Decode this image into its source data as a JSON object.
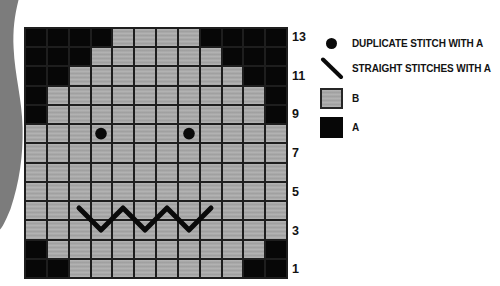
{
  "page": {
    "background": "#ffffff"
  },
  "colors": {
    "color_a": "#070707",
    "color_b": "#a9a9a9",
    "grid_line": "#1e1e1e",
    "ribbon": "#7c7c7c",
    "text": "#131313"
  },
  "chart": {
    "columns": 12,
    "row_count": 13,
    "rows": [
      {
        "row": 13,
        "cells": "AAAABBBBAAAA"
      },
      {
        "row": 12,
        "cells": "AAABBBBBBAAA"
      },
      {
        "row": 11,
        "cells": "AABBBBBBBBAA"
      },
      {
        "row": 10,
        "cells": "ABBBBBBBBBBA"
      },
      {
        "row": 9,
        "cells": "ABBBBBBBBBBA"
      },
      {
        "row": 8,
        "cells": "BBBBBBBBBBBB"
      },
      {
        "row": 7,
        "cells": "BBBBBBBBBBBB"
      },
      {
        "row": 6,
        "cells": "BBBBBBBBBBBB"
      },
      {
        "row": 5,
        "cells": "BBBBBBBBBBBB"
      },
      {
        "row": 4,
        "cells": "BBBBBBBBBBBB"
      },
      {
        "row": 3,
        "cells": "BBBBBBBBBBBB"
      },
      {
        "row": 2,
        "cells": "ABBBBBBBBBBA"
      },
      {
        "row": 1,
        "cells": "AABBBBBBBBAA"
      }
    ],
    "visible_row_labels": [
      "13",
      "11",
      "9",
      "7",
      "5",
      "3",
      "1"
    ],
    "duplicate_stitches_a": [
      {
        "row": 8,
        "col": 4
      },
      {
        "row": 8,
        "col": 8
      }
    ],
    "straight_stitches_a": {
      "shape": "zigzag",
      "points_col_row_units": [
        [
          2.5,
          9.33
        ],
        [
          3.5,
          10.47
        ],
        [
          4.5,
          9.33
        ],
        [
          5.5,
          10.47
        ],
        [
          6.5,
          9.33
        ],
        [
          7.5,
          10.47
        ],
        [
          8.5,
          9.33
        ]
      ]
    }
  },
  "legend": {
    "items": [
      {
        "icon": "filled-circle",
        "label": "DUPLICATE STITCH WITH A"
      },
      {
        "icon": "diagonal-line",
        "label": "STRAIGHT STITCHES WITH A"
      },
      {
        "icon": "color-b-swatch",
        "label": "B"
      },
      {
        "icon": "color-a-swatch",
        "label": "A"
      }
    ]
  }
}
